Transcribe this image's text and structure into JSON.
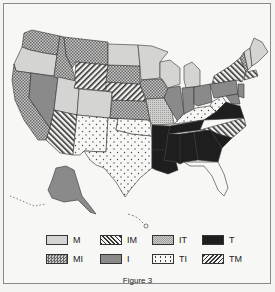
{
  "figure": {
    "caption": "Figure 3"
  },
  "legend": {
    "items": [
      {
        "code": "M",
        "label": "M",
        "pattern": "light-gray-solid"
      },
      {
        "code": "IM",
        "label": "IM",
        "pattern": "diagonal-back-hatch"
      },
      {
        "code": "IT",
        "label": "IT",
        "pattern": "fine-stipple"
      },
      {
        "code": "T",
        "label": "T",
        "pattern": "black-solid"
      },
      {
        "code": "MI",
        "label": "MI",
        "pattern": "crosshatch-checker"
      },
      {
        "code": "I",
        "label": "I",
        "pattern": "medium-gray-solid"
      },
      {
        "code": "TI",
        "label": "TI",
        "pattern": "dots"
      },
      {
        "code": "TM",
        "label": "TM",
        "pattern": "diagonal-forward-hatch"
      }
    ]
  },
  "colors": {
    "M": "#d4d4d2",
    "I": "#8a8a8a",
    "T": "#1e1e1e",
    "border": "#333333",
    "background": "#f7f7f5"
  },
  "map": {
    "regions": [
      {
        "state": "Washington",
        "category": "MI"
      },
      {
        "state": "Oregon",
        "category": "M"
      },
      {
        "state": "California",
        "category": "MI"
      },
      {
        "state": "Nevada",
        "category": "I"
      },
      {
        "state": "Idaho",
        "category": "MI"
      },
      {
        "state": "Montana",
        "category": "MI"
      },
      {
        "state": "Wyoming",
        "category": "IM"
      },
      {
        "state": "Utah",
        "category": "M"
      },
      {
        "state": "Colorado",
        "category": "M"
      },
      {
        "state": "Arizona",
        "category": "TM"
      },
      {
        "state": "New Mexico",
        "category": "TI"
      },
      {
        "state": "Texas",
        "category": "TI"
      },
      {
        "state": "Oklahoma",
        "category": "TI"
      },
      {
        "state": "Kansas",
        "category": "MI"
      },
      {
        "state": "Nebraska",
        "category": "IM"
      },
      {
        "state": "South Dakota",
        "category": "MI"
      },
      {
        "state": "North Dakota",
        "category": "M"
      },
      {
        "state": "Minnesota",
        "category": "M"
      },
      {
        "state": "Iowa",
        "category": "MI"
      },
      {
        "state": "Missouri",
        "category": "IT"
      },
      {
        "state": "Wisconsin",
        "category": "M"
      },
      {
        "state": "Illinois",
        "category": "I"
      },
      {
        "state": "Michigan",
        "category": "M"
      },
      {
        "state": "Indiana",
        "category": "I"
      },
      {
        "state": "Ohio",
        "category": "I"
      },
      {
        "state": "Kentucky",
        "category": "TI"
      },
      {
        "state": "West Virginia",
        "category": "TI"
      },
      {
        "state": "Pennsylvania",
        "category": "I"
      },
      {
        "state": "New York",
        "category": "TM"
      },
      {
        "state": "Vermont",
        "category": "MI"
      },
      {
        "state": "New Hampshire",
        "category": "M"
      },
      {
        "state": "Maine",
        "category": "M"
      },
      {
        "state": "Massachusetts",
        "category": "TM"
      },
      {
        "state": "New Jersey",
        "category": "I"
      },
      {
        "state": "Maryland",
        "category": "I"
      },
      {
        "state": "Virginia",
        "category": "T"
      },
      {
        "state": "North Carolina",
        "category": "TM"
      },
      {
        "state": "Tennessee",
        "category": "T"
      },
      {
        "state": "Arkansas",
        "category": "T"
      },
      {
        "state": "Louisiana",
        "category": "T"
      },
      {
        "state": "Mississippi",
        "category": "T"
      },
      {
        "state": "Alabama",
        "category": "T"
      },
      {
        "state": "Georgia",
        "category": "T"
      },
      {
        "state": "South Carolina",
        "category": "T"
      },
      {
        "state": "Florida",
        "category": "none"
      },
      {
        "state": "Alaska",
        "category": "I"
      },
      {
        "state": "Hawaii",
        "category": "none"
      }
    ]
  }
}
